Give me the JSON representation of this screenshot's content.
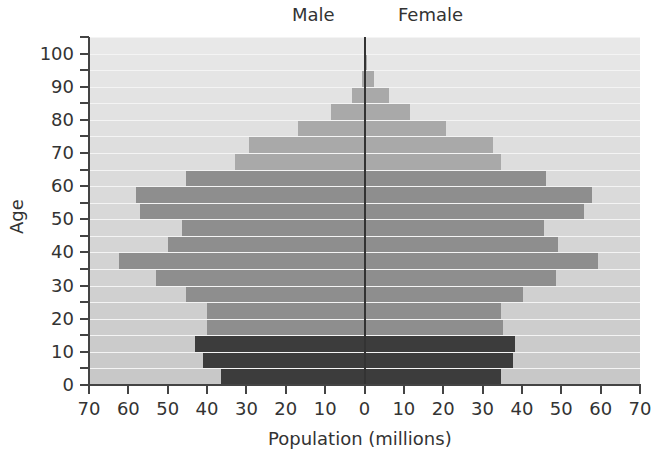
{
  "chart_data": {
    "type": "bar",
    "subtype": "population-pyramid",
    "title": "",
    "side_labels": {
      "left": "Male",
      "right": "Female"
    },
    "xlabel": "Population (millions)",
    "ylabel": "Age",
    "xlim": [
      -70,
      70
    ],
    "ylim": [
      0,
      105
    ],
    "x_ticks": [
      "70",
      "60",
      "50",
      "40",
      "30",
      "20",
      "10",
      "0",
      "10",
      "20",
      "30",
      "40",
      "50",
      "60",
      "70"
    ],
    "y_ticks": [
      "0",
      "10",
      "20",
      "30",
      "40",
      "50",
      "60",
      "70",
      "80",
      "90",
      "100"
    ],
    "categories": [
      "0-4",
      "5-9",
      "10-14",
      "15-19",
      "20-24",
      "25-29",
      "30-34",
      "35-39",
      "40-44",
      "45-49",
      "50-54",
      "55-59",
      "60-64",
      "65-69",
      "70-74",
      "75-79",
      "80-84",
      "85-89",
      "90-94",
      "95-99",
      "100+"
    ],
    "series": [
      {
        "name": "Male",
        "values": [
          36.5,
          41,
          43,
          40,
          40,
          45.5,
          53,
          62.5,
          50,
          46.5,
          57,
          58,
          45.5,
          33,
          29.5,
          17,
          8.5,
          3.3,
          0.8,
          0.2,
          0
        ]
      },
      {
        "name": "Female",
        "values": [
          34.5,
          37.5,
          38,
          35,
          34.5,
          40,
          48.5,
          59,
          49,
          45.5,
          55.5,
          57.5,
          46,
          34.5,
          32.5,
          20.5,
          11.5,
          6,
          2.3,
          0.5,
          0
        ]
      }
    ],
    "group_colors": {
      "0-14": "#3c3c3c",
      "15-64": "#8e8e8e",
      "65+": "#a9a9a9"
    },
    "background_band_color": "#d9d9d9",
    "grid": false,
    "legend": "none"
  },
  "labels": {
    "male": "Male",
    "female": "Female",
    "age": "Age",
    "xaxis": "Population (millions)"
  }
}
